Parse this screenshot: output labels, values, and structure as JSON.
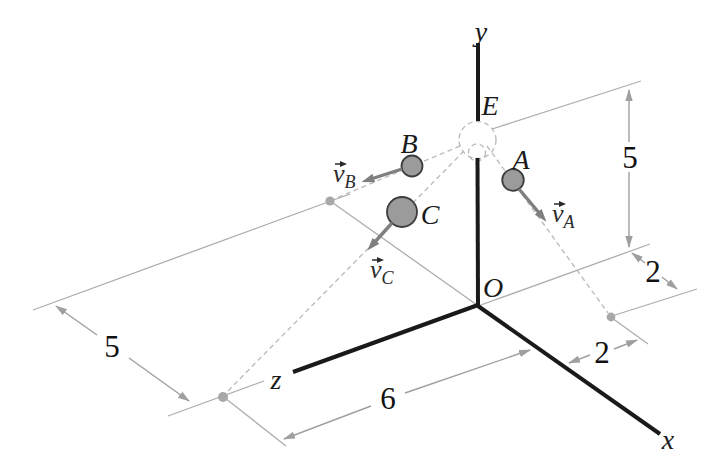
{
  "axes": {
    "x_label": "x",
    "y_label": "y",
    "z_label": "z",
    "origin_label": "O"
  },
  "points": {
    "E": "E",
    "A": "A",
    "B": "B",
    "C": "C"
  },
  "vectors": {
    "vA": {
      "symbol": "v",
      "subscript": "A"
    },
    "vB": {
      "symbol": "v",
      "subscript": "B"
    },
    "vC": {
      "symbol": "v",
      "subscript": "C"
    }
  },
  "dimensions": {
    "e_height": "5",
    "left_span": "5",
    "z_span": "6",
    "x_offset_right": "2",
    "z_offset_right": "2"
  },
  "colors": {
    "background": "#ffffff",
    "axis": "#1a1a1a",
    "ball_fill": "#9b9b9b",
    "ball_stroke": "#3d3d3d",
    "vector_gray": "#7f7f7f",
    "dimension_gray": "#9f9f9f",
    "thin_line_gray": "#adadad",
    "dashed_gray": "#bdbdbd"
  }
}
